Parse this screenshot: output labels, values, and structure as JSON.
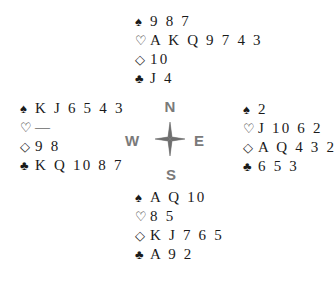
{
  "suits": {
    "spade": "♠",
    "heart": "♡",
    "diamond": "◇",
    "club": "♣"
  },
  "compass": {
    "north": "N",
    "south": "S",
    "east": "E",
    "west": "W",
    "icon": "compass-star-icon",
    "color": "#7a7a7a"
  },
  "hands": {
    "north": {
      "label": "North",
      "spades": "9 8 7",
      "hearts": "A K Q 9 7 4 3",
      "diamonds": "10",
      "clubs": "J 4"
    },
    "west": {
      "label": "West",
      "spades": "K J 6 5 4 3",
      "hearts": "—",
      "diamonds": "9 8",
      "clubs": "K Q 10 8 7"
    },
    "east": {
      "label": "East",
      "spades": "2",
      "hearts": "J 10 6 2",
      "diamonds": "A Q 4 3 2",
      "clubs": "6 5 3"
    },
    "south": {
      "label": "South",
      "spades": "A Q 10",
      "hearts": "8 5",
      "diamonds": "K J 7 6 5",
      "clubs": "A 9 2"
    }
  }
}
